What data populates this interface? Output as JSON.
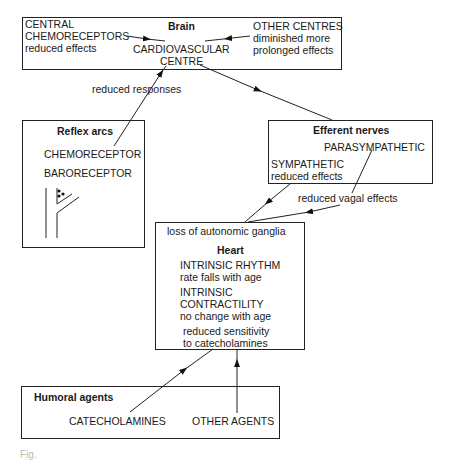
{
  "brain": {
    "title": "Brain",
    "central_chemo": [
      "CENTRAL",
      "CHEMORECEPTORS",
      "reduced effects"
    ],
    "cardio_centre": [
      "CARDIOVASCULAR",
      "CENTRE"
    ],
    "other_centres": [
      "OTHER CENTRES",
      "diminished more",
      "prolonged effects"
    ]
  },
  "labels": {
    "reduced_responses": "reduced responses",
    "reduced_vagal": "reduced vagal effects"
  },
  "reflex": {
    "title": "Reflex arcs",
    "chemo": "CHEMORECEPTOR",
    "baro": "BARORECEPTOR"
  },
  "efferent": {
    "title": "Efferent nerves",
    "para": "PARASYMPATHETIC",
    "symp": [
      "SYMPATHETIC",
      "reduced effects"
    ]
  },
  "heart": {
    "ganglia": "loss of autonomic ganglia",
    "title": "Heart",
    "rhythm": [
      "INTRINSIC RHYTHM",
      "rate falls with age"
    ],
    "contract": [
      "INTRINSIC",
      "CONTRACTILITY",
      "no change with age"
    ],
    "sens": [
      "reduced sensitivity",
      "to catecholamines"
    ]
  },
  "humoral": {
    "title": "Humoral agents",
    "cat": "CATECHOLAMINES",
    "other": "OTHER AGENTS"
  },
  "caption": "Fig."
}
